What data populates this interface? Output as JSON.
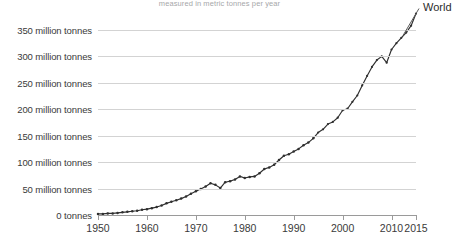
{
  "subtitle": "measured in metric tonnes per year",
  "series_label": "World",
  "axes": {
    "y_ticks": [
      {
        "value": 0,
        "label": "0 tonnes"
      },
      {
        "value": 50,
        "label": "50 million tonnes"
      },
      {
        "value": 100,
        "label": "100 million tonnes"
      },
      {
        "value": 150,
        "label": "150 million tonnes"
      },
      {
        "value": 200,
        "label": "200 million tonnes"
      },
      {
        "value": 250,
        "label": "250 million tonnes"
      },
      {
        "value": 300,
        "label": "300 million tonnes"
      },
      {
        "value": 350,
        "label": "350 million tonnes"
      }
    ],
    "x_ticks": [
      {
        "value": 1950,
        "label": "1950"
      },
      {
        "value": 1960,
        "label": "1960"
      },
      {
        "value": 1970,
        "label": "1970"
      },
      {
        "value": 1980,
        "label": "1980"
      },
      {
        "value": 1990,
        "label": "1990"
      },
      {
        "value": 2000,
        "label": "2000"
      },
      {
        "value": 2010,
        "label": "2010"
      },
      {
        "value": 2015,
        "label": "2015"
      }
    ]
  },
  "chart_data": {
    "type": "line",
    "title": "",
    "subtitle": "measured in metric tonnes per year",
    "xlabel": "",
    "ylabel": "",
    "xlim": [
      1950,
      2015
    ],
    "ylim": [
      0,
      365
    ],
    "grid": true,
    "legend_position": "right-end-label",
    "markers": true,
    "series": [
      {
        "name": "World",
        "color": "#2f2f2f",
        "x": [
          1950,
          1951,
          1952,
          1953,
          1954,
          1955,
          1956,
          1957,
          1958,
          1959,
          1960,
          1961,
          1962,
          1963,
          1964,
          1965,
          1966,
          1967,
          1968,
          1969,
          1970,
          1971,
          1972,
          1973,
          1974,
          1975,
          1976,
          1977,
          1978,
          1979,
          1980,
          1981,
          1982,
          1983,
          1984,
          1985,
          1986,
          1987,
          1988,
          1989,
          1990,
          1991,
          1992,
          1993,
          1994,
          1995,
          1996,
          1997,
          1998,
          1999,
          2000,
          2001,
          2002,
          2003,
          2004,
          2005,
          2006,
          2007,
          2008,
          2009,
          2010,
          2011,
          2012,
          2013,
          2014,
          2015
        ],
        "values": [
          2,
          2,
          3,
          3,
          4,
          5,
          6,
          7,
          8,
          10,
          11,
          13,
          15,
          18,
          22,
          25,
          28,
          31,
          35,
          40,
          45,
          49,
          54,
          60,
          57,
          51,
          62,
          64,
          67,
          73,
          70,
          72,
          73,
          79,
          87,
          90,
          95,
          104,
          112,
          115,
          120,
          125,
          132,
          137,
          145,
          156,
          162,
          172,
          176,
          184,
          198,
          201,
          214,
          226,
          245,
          263,
          280,
          293,
          300,
          288,
          313,
          325,
          335,
          345,
          358,
          381
        ]
      }
    ],
    "annotations": [
      {
        "text": "1974-75 oil crisis dip",
        "x": 1975,
        "y": 51
      },
      {
        "text": "2008-09 financial crisis dip",
        "x": 2009,
        "y": 288
      }
    ]
  }
}
